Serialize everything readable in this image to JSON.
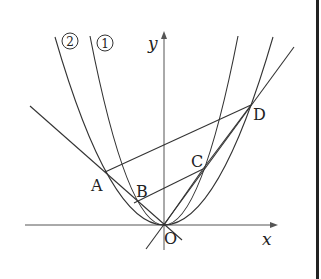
{
  "diagram": {
    "axes": {
      "x_label": "x",
      "y_label": "y",
      "origin_label": "O"
    },
    "curves": [
      {
        "label": "①",
        "description": "narrower parabola y = a x^2"
      },
      {
        "label": "②",
        "description": "wider parabola y = b x^2"
      }
    ],
    "points": {
      "A": "A",
      "B": "B",
      "C": "C",
      "D": "D"
    },
    "segments": [
      "AD",
      "BC",
      "AO",
      "OD",
      "OC"
    ],
    "colors": {
      "line": "#333333",
      "border": "#222222"
    }
  }
}
